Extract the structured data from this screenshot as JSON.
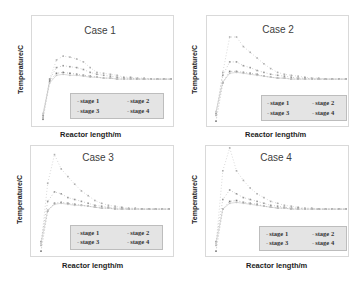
{
  "chart_data": [
    {
      "type": "line",
      "title": "Case 1",
      "xlabel": "Reactor length/m",
      "ylabel": "Temperature/C",
      "legend": [
        "stage 1",
        "stage 2",
        "stage 3",
        "stage 4"
      ],
      "legend_position": "lower right (inside)",
      "grid": false,
      "x": [
        0,
        1,
        2,
        3,
        4,
        5,
        6,
        7,
        8,
        9,
        10,
        11,
        12,
        13,
        14,
        15,
        16,
        17,
        18,
        19
      ],
      "series": [
        {
          "name": "stage 1",
          "values": [
            8,
            48,
            68,
            72,
            71,
            69,
            66,
            60,
            55,
            54,
            53,
            52,
            50,
            50,
            49,
            49,
            48,
            48,
            48,
            48
          ]
        },
        {
          "name": "stage 2",
          "values": [
            10,
            48,
            60,
            62,
            61,
            60,
            58,
            55,
            53,
            52,
            51,
            50,
            49,
            49,
            48,
            48,
            48,
            48,
            48,
            48
          ]
        },
        {
          "name": "stage 3",
          "values": [
            6,
            46,
            54,
            55,
            54,
            53,
            52,
            51,
            50,
            49,
            49,
            48,
            48,
            48,
            48,
            48,
            48,
            48,
            48,
            48
          ]
        },
        {
          "name": "stage 4",
          "values": [
            12,
            44,
            52,
            53,
            52,
            52,
            51,
            50,
            50,
            49,
            49,
            48,
            48,
            48,
            48,
            48,
            48,
            48,
            48,
            48
          ]
        }
      ]
    },
    {
      "type": "line",
      "title": "Case 2",
      "xlabel": "Reactor length/m",
      "ylabel": "Temperature/C",
      "legend": [
        "stage 1",
        "stage 2",
        "stage 3",
        "stage 4"
      ],
      "legend_position": "lower right (inside)",
      "grid": false,
      "x": [
        0,
        1,
        2,
        3,
        4,
        5,
        6,
        7,
        8,
        9,
        10,
        11,
        12,
        13,
        14,
        15,
        16,
        17,
        18,
        19
      ],
      "series": [
        {
          "name": "stage 1",
          "values": [
            10,
            55,
            92,
            92,
            82,
            76,
            70,
            64,
            59,
            55,
            53,
            52,
            51,
            50,
            49,
            49,
            48,
            48,
            48,
            48
          ]
        },
        {
          "name": "stage 2",
          "values": [
            12,
            52,
            66,
            66,
            62,
            60,
            57,
            55,
            53,
            52,
            51,
            50,
            49,
            49,
            48,
            48,
            48,
            48,
            48,
            48
          ]
        },
        {
          "name": "stage 3",
          "values": [
            4,
            44,
            56,
            56,
            55,
            54,
            53,
            51,
            50,
            49,
            49,
            48,
            48,
            48,
            48,
            48,
            48,
            48,
            48,
            48
          ]
        },
        {
          "name": "stage 4",
          "values": [
            14,
            45,
            54,
            55,
            54,
            53,
            52,
            51,
            50,
            49,
            49,
            48,
            48,
            48,
            48,
            48,
            48,
            48,
            48,
            48
          ]
        }
      ]
    },
    {
      "type": "line",
      "title": "Case 3",
      "xlabel": "Reactor length/m",
      "ylabel": "Temperature/C",
      "legend": [
        "stage 1",
        "stage 2",
        "stage 3",
        "stage 4"
      ],
      "legend_position": "lower right (inside)",
      "grid": false,
      "x": [
        0,
        1,
        2,
        3,
        4,
        5,
        6,
        7,
        8,
        9,
        10,
        11,
        12,
        13,
        14,
        15,
        16,
        17,
        18,
        19
      ],
      "series": [
        {
          "name": "stage 1",
          "values": [
            10,
            75,
            105,
            90,
            82,
            74,
            67,
            62,
            57,
            54,
            52,
            51,
            50,
            49,
            49,
            48,
            48,
            48,
            48,
            48
          ]
        },
        {
          "name": "stage 2",
          "values": [
            14,
            56,
            66,
            64,
            60,
            58,
            56,
            54,
            52,
            51,
            50,
            49,
            49,
            48,
            48,
            48,
            48,
            48,
            48,
            48
          ]
        },
        {
          "name": "stage 3",
          "values": [
            4,
            46,
            54,
            55,
            54,
            53,
            52,
            51,
            50,
            49,
            49,
            48,
            48,
            48,
            48,
            48,
            48,
            48,
            48,
            48
          ]
        },
        {
          "name": "stage 4",
          "values": [
            12,
            47,
            53,
            54,
            53,
            52,
            52,
            51,
            50,
            49,
            49,
            48,
            48,
            48,
            48,
            48,
            48,
            48,
            48,
            48
          ]
        }
      ]
    },
    {
      "type": "line",
      "title": "Case 4",
      "xlabel": "Reactor length/m",
      "ylabel": "Temperature/C",
      "legend": [
        "stage 1",
        "stage 2",
        "stage 3",
        "stage 4"
      ],
      "legend_position": "lower right (inside)",
      "grid": false,
      "x": [
        0,
        1,
        2,
        3,
        4,
        5,
        6,
        7,
        8,
        9,
        10,
        11,
        12,
        13,
        14,
        15,
        16,
        17,
        18,
        19
      ],
      "series": [
        {
          "name": "stage 1",
          "values": [
            10,
            88,
            112,
            88,
            78,
            70,
            64,
            60,
            56,
            54,
            52,
            51,
            50,
            49,
            49,
            48,
            48,
            48,
            48,
            48
          ]
        },
        {
          "name": "stage 2",
          "values": [
            14,
            58,
            68,
            64,
            60,
            58,
            56,
            54,
            52,
            51,
            50,
            49,
            49,
            48,
            48,
            48,
            48,
            48,
            48,
            48
          ]
        },
        {
          "name": "stage 3",
          "values": [
            4,
            48,
            56,
            57,
            55,
            54,
            53,
            51,
            50,
            49,
            49,
            48,
            48,
            48,
            48,
            48,
            48,
            48,
            48,
            48
          ]
        },
        {
          "name": "stage 4",
          "values": [
            12,
            48,
            54,
            55,
            54,
            53,
            52,
            51,
            50,
            49,
            49,
            48,
            48,
            48,
            48,
            48,
            48,
            48,
            48,
            48
          ]
        }
      ]
    }
  ],
  "colors": {
    "stage1": "#b0b0b0",
    "stage2": "#9a9a9a",
    "stage3": "#7d7d7d",
    "stage4": "#c4c4c4",
    "frame": "#d9d9d9",
    "legend_bg": "#e4e4e4"
  },
  "panels": [
    {
      "title": "Case 1",
      "ylabel": "Temperature/C",
      "xlabel": "Reactor length/m",
      "legend": [
        "stage 1",
        "stage 2",
        "stage 3",
        "stage 4"
      ]
    },
    {
      "title": "Case 2",
      "ylabel": "Temperature/C",
      "xlabel": "Reactor length/m",
      "legend": [
        "stage 1",
        "stage 2",
        "stage 3",
        "stage 4"
      ]
    },
    {
      "title": "Case 3",
      "ylabel": "Temperature/C",
      "xlabel": "Reactor length/m",
      "legend": [
        "stage 1",
        "stage 2",
        "stage 3",
        "stage 4"
      ]
    },
    {
      "title": "Case 4",
      "ylabel": "Temperature/C",
      "xlabel": "Reactor length/m",
      "legend": [
        "stage 1",
        "stage 2",
        "stage 3",
        "stage 4"
      ]
    }
  ]
}
